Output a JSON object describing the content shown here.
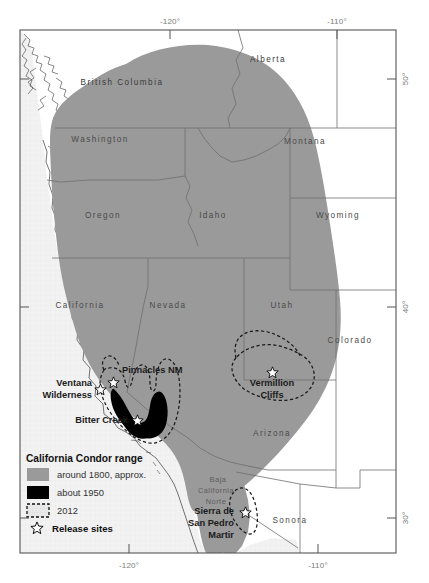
{
  "map": {
    "title": "California Condor range map",
    "frame": {
      "left": 20,
      "top": 30,
      "right": 396,
      "bottom": 553
    },
    "colors": {
      "ocean": "#f0f0f0",
      "land": "#ffffff",
      "range_1800": "#9a9a9a",
      "range_1950": "#000000",
      "range_2012_outline": "#1a1a1a",
      "border": "#6e6e6e",
      "frame": "#555555",
      "coastline": "#2b2b2b",
      "label_gray": "#4a4a4a"
    },
    "axis": {
      "top_ticks": [
        {
          "label": "-120°",
          "x": 170
        },
        {
          "label": "-110°",
          "x": 337
        }
      ],
      "bottom_ticks": [
        {
          "label": "-120°",
          "x": 129
        },
        {
          "label": "-110°",
          "x": 318
        }
      ],
      "right_ticks": [
        {
          "label": "50°",
          "y": 79
        },
        {
          "label": "40°",
          "y": 307
        },
        {
          "label": "30°",
          "y": 518
        }
      ],
      "left_ticks": [
        {
          "label": "",
          "y": 79
        },
        {
          "label": "",
          "y": 307
        },
        {
          "label": "",
          "y": 518
        }
      ]
    },
    "state_labels": [
      {
        "name": "British Columbia",
        "x": 122,
        "y": 85
      },
      {
        "name": "Alberta",
        "x": 268,
        "y": 62
      },
      {
        "name": "Washington",
        "x": 100,
        "y": 142
      },
      {
        "name": "Montana",
        "x": 305,
        "y": 144
      },
      {
        "name": "Oregon",
        "x": 103,
        "y": 218
      },
      {
        "name": "Idaho",
        "x": 213,
        "y": 218
      },
      {
        "name": "Wyoming",
        "x": 338,
        "y": 218
      },
      {
        "name": "California",
        "x": 80,
        "y": 308
      },
      {
        "name": "Nevada",
        "x": 168,
        "y": 308
      },
      {
        "name": "Utah",
        "x": 282,
        "y": 308
      },
      {
        "name": "Colorado",
        "x": 347,
        "y": 343
      },
      {
        "name": "Arizona",
        "x": 272,
        "y": 436
      },
      {
        "name": "Sonora",
        "x": 290,
        "y": 523
      }
    ],
    "baja_labels": [
      {
        "name": "Baja",
        "x": 216,
        "y": 481
      },
      {
        "name": "California",
        "x": 208,
        "y": 492
      },
      {
        "name": "Norte",
        "x": 210,
        "y": 503
      }
    ],
    "release_sites": [
      {
        "name": "Pinnacles NM",
        "label_x": 122,
        "label_y": 372,
        "star_x": 113,
        "star_y": 382,
        "anchor": "start"
      },
      {
        "name": "Ventana Wilderness",
        "line1": "Ventana",
        "line2": "Wilderness",
        "label_x": 92,
        "label_y": 390,
        "star_x": 100,
        "star_y": 389,
        "anchor": "end"
      },
      {
        "name": "Bitter Creek",
        "label_x": 112,
        "label_y": 424,
        "star_x": 137,
        "star_y": 420,
        "anchor": "end"
      },
      {
        "name": "Vermillion Cliffs",
        "line1": "Vermillion",
        "line2": "Cliffs",
        "label_x": 272,
        "label_y": 385,
        "star_x": 272,
        "star_y": 372,
        "anchor": "middle"
      },
      {
        "name": "Sierra de San Pedro Martir",
        "line1": "Sierra de",
        "line2": "San Pedro",
        "line3": "Martir",
        "label_x": 207,
        "label_y": 515,
        "star_x": 245,
        "star_y": 512,
        "anchor": "end"
      }
    ],
    "legend": {
      "title": "California Condor range",
      "x": 26,
      "y": 458,
      "entries": [
        {
          "label": "around 1800, approx.",
          "swatch": "gray",
          "key": "range-1800"
        },
        {
          "label": "about 1950",
          "swatch": "black",
          "key": "range-1950"
        },
        {
          "label": "2012",
          "swatch": "dashed",
          "key": "range-2012"
        }
      ],
      "release_sites_label": "Release sites",
      "release_sites_icon": "star-outline-icon"
    }
  }
}
